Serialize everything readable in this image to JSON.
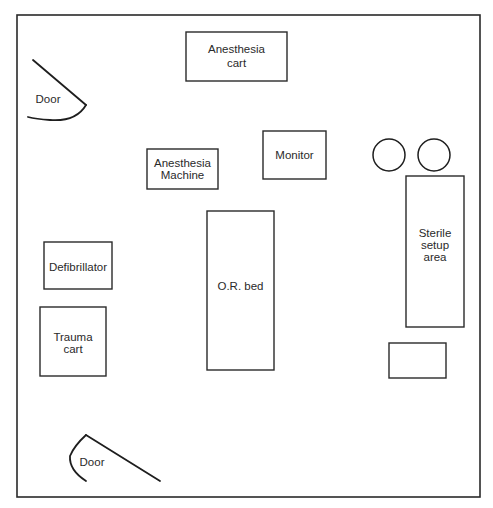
{
  "diagram": {
    "labels": {
      "anesthesia_cart": [
        "Anesthesia",
        "cart"
      ],
      "door_top": "Door",
      "anesthesia_machine": [
        "Anesthesia",
        "Machine"
      ],
      "monitor": "Monitor",
      "sterile_setup": [
        "Sterile",
        "setup",
        "area"
      ],
      "or_bed": "O.R. bed",
      "defibrillator": "Defibrillator",
      "trauma_cart": [
        "Trauma",
        "cart"
      ],
      "door_bottom": "Door"
    }
  }
}
